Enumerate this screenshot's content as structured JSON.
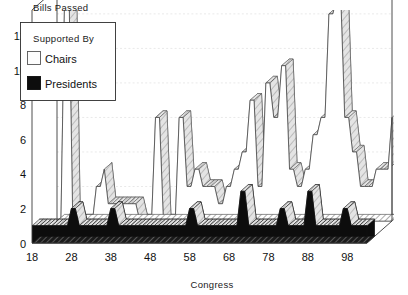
{
  "title": "Bills Passed",
  "legend": {
    "heading": "Supported By",
    "items": [
      {
        "label": "Chairs",
        "swatch": "white-square-icon",
        "color": "#fdfdfd"
      },
      {
        "label": "Presidents",
        "swatch": "black-square-icon",
        "color": "#0d0d0d"
      }
    ]
  },
  "axes": {
    "xlabel": "Congress",
    "ylabel": "",
    "xticks": [
      "18",
      "28",
      "38",
      "48",
      "58",
      "68",
      "78",
      "88",
      "98"
    ],
    "yticks": [
      "0",
      "2",
      "4",
      "6",
      "8",
      "10",
      "12"
    ]
  },
  "chart_data": {
    "type": "area",
    "title": "Bills Passed",
    "xlabel": "Congress",
    "ylabel": "Bills Passed",
    "xlim": [
      18,
      103
    ],
    "ylim": [
      0,
      13.5
    ],
    "xticks": [
      18,
      28,
      38,
      48,
      58,
      68,
      78,
      88,
      98
    ],
    "yticks": [
      0,
      2,
      4,
      6,
      8,
      10,
      12
    ],
    "grid": "horizontal-dotted",
    "legend_position": "top-left",
    "projection": "3d-ribbon",
    "x": [
      18,
      19,
      20,
      21,
      22,
      23,
      24,
      25,
      26,
      27,
      28,
      29,
      30,
      31,
      32,
      33,
      34,
      35,
      36,
      37,
      38,
      39,
      40,
      41,
      42,
      43,
      44,
      45,
      46,
      47,
      48,
      49,
      50,
      51,
      52,
      53,
      54,
      55,
      56,
      57,
      58,
      59,
      60,
      61,
      62,
      63,
      64,
      65,
      66,
      67,
      68,
      69,
      70,
      71,
      72,
      73,
      74,
      75,
      76,
      77,
      78,
      79,
      80,
      81,
      82,
      83,
      84,
      85,
      86,
      87,
      88,
      89,
      90,
      91,
      92,
      93,
      94,
      95,
      96,
      97,
      98,
      99,
      100,
      101,
      102,
      103
    ],
    "series": [
      {
        "name": "Chairs",
        "color": "#fdfdfd",
        "values": [
          0,
          0,
          14,
          14,
          0,
          0,
          0,
          0,
          0,
          0,
          2,
          2,
          3,
          1,
          1,
          1,
          1,
          1,
          1,
          1,
          1,
          0,
          0,
          0,
          0,
          6,
          6,
          0,
          0,
          0,
          0,
          6,
          6,
          2,
          2,
          3,
          3,
          2,
          2,
          2,
          2,
          1,
          1,
          2,
          2,
          3,
          3,
          4,
          4,
          7,
          7,
          2,
          2,
          8,
          8,
          6,
          6,
          9,
          9,
          3,
          3,
          2,
          2,
          3,
          3,
          5,
          5,
          6,
          6,
          12,
          12,
          13,
          13,
          6,
          6,
          4,
          4,
          2,
          2,
          2,
          2,
          3,
          3,
          3,
          3,
          6
        ]
      },
      {
        "name": "Presidents",
        "color": "#0d0d0d",
        "values": [
          1,
          1,
          1,
          1,
          1,
          1,
          1,
          1,
          1,
          1,
          2,
          2,
          1,
          1,
          1,
          1,
          1,
          1,
          1,
          1,
          2,
          2,
          1,
          1,
          1,
          1,
          1,
          1,
          1,
          1,
          1,
          1,
          1,
          1,
          1,
          1,
          1,
          1,
          1,
          1,
          2,
          2,
          1,
          1,
          1,
          1,
          1,
          1,
          1,
          1,
          1,
          1,
          1,
          3,
          3,
          1,
          1,
          1,
          1,
          1,
          1,
          1,
          1,
          2,
          2,
          1,
          1,
          1,
          1,
          1,
          3,
          3,
          1,
          1,
          1,
          1,
          1,
          1,
          1,
          2,
          2,
          1,
          1,
          1,
          1,
          1
        ]
      }
    ]
  }
}
